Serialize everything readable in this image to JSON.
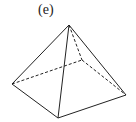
{
  "figure": {
    "label": "(e)",
    "shape": "square pyramid",
    "vertices": {
      "apex": [
        69,
        25
      ],
      "left": [
        12,
        84
      ],
      "front": [
        58,
        118
      ],
      "right": [
        126,
        95
      ],
      "back": [
        82,
        60
      ]
    },
    "stroke_color": "#222222"
  }
}
